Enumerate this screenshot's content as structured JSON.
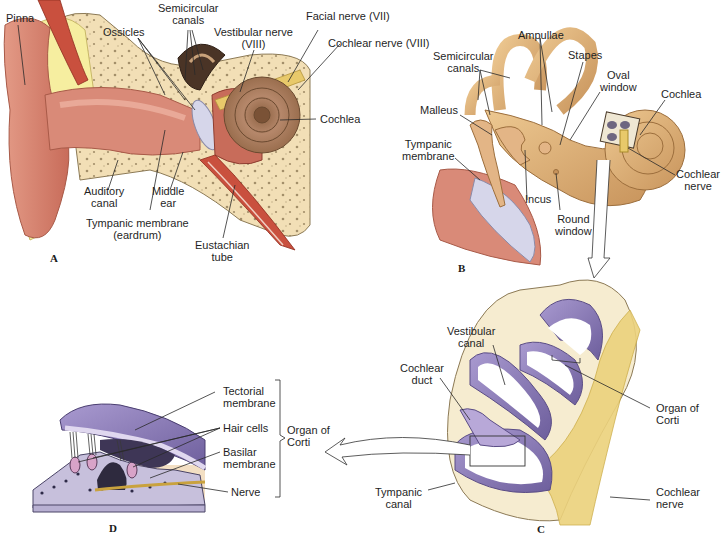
{
  "figure": {
    "panels": [
      {
        "id": "A",
        "letter": "A",
        "description": "Outer, middle and inner ear cross-section",
        "labels": {
          "pinna": "Pinna",
          "ossicles": "Ossicles",
          "semicircular_canals": "Semicircular\ncanals",
          "vestibular_nerve": "Vestibular nerve\n(VIII)",
          "facial_nerve": "Facial nerve (VII)",
          "cochlear_nerve": "Cochlear nerve (VIII)",
          "cochlea": "Cochlea",
          "auditory_canal": "Auditory\ncanal",
          "middle_ear": "Middle\near",
          "tympanic_membrane": "Tympanic membrane\n(eardrum)",
          "eustachian_tube": "Eustachian\ntube"
        }
      },
      {
        "id": "B",
        "letter": "B",
        "description": "Middle ear ossicles and inner ear labyrinth",
        "labels": {
          "ampullae": "Ampullae",
          "semicircular_canals": "Semicircular\ncanals",
          "stapes": "Stapes",
          "oval_window": "Oval\nwindow",
          "cochlea": "Cochlea",
          "malleus": "Malleus",
          "tympanic_membrane": "Tympanic\nmembrane",
          "incus": "Incus",
          "round_window": "Round\nwindow",
          "cochlear_nerve": "Cochlear\nnerve"
        }
      },
      {
        "id": "C",
        "letter": "C",
        "description": "Cross-section through the cochlea",
        "labels": {
          "vestibular_canal": "Vestibular\ncanal",
          "cochlear_duct": "Cochlear\nduct",
          "organ_of_corti": "Organ of\nCorti",
          "tympanic_canal": "Tympanic\ncanal",
          "cochlear_nerve": "Cochlear\nnerve"
        }
      },
      {
        "id": "D",
        "letter": "D",
        "description": "Detail of the organ of Corti",
        "labels": {
          "tectorial_membrane": "Tectorial\nmembrane",
          "hair_cells": "Hair cells",
          "basilar_membrane": "Basilar\nmembrane",
          "nerve": "Nerve",
          "organ_of_corti": "Organ of\nCorti"
        }
      }
    ],
    "colors": {
      "skin": "#d98a78",
      "skin_dark": "#b45a4a",
      "bone": "#f2dfb6",
      "bone_spots": "#a38f6a",
      "cochlea_brown": "#a77c58",
      "labyrinth_tan": "#d9ae78",
      "nerve_yellow": "#e8c96a",
      "membrane_purple": "#8e7cb4",
      "membrane_light": "#d7cfe9",
      "eardrum": "#d6d6ea",
      "muscle_red": "#c9503e",
      "fat_yellow": "#f6eea0",
      "leader_line": "#2a2a2a"
    }
  }
}
